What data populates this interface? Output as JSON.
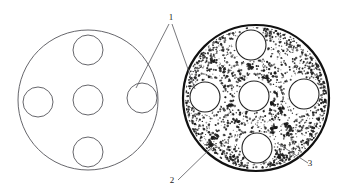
{
  "figure": {
    "background_color": "#ffffff",
    "line_color": "#55555a",
    "heavy_line_color": "#111111",
    "stipple_color": "#1a1a1a",
    "width": 342,
    "height": 194
  },
  "callouts": [
    {
      "id": "callout-1",
      "label": "1",
      "label_x": 171,
      "label_y": 20,
      "leaders": [
        {
          "x1": 169,
          "y1": 24,
          "x2": 136,
          "y2": 88
        },
        {
          "x1": 172,
          "y1": 24,
          "x2": 195,
          "y2": 89
        }
      ]
    },
    {
      "id": "callout-2",
      "label": "2",
      "label_x": 172,
      "label_y": 183,
      "leaders": [
        {
          "x1": 178,
          "y1": 180,
          "x2": 216,
          "y2": 143
        }
      ]
    },
    {
      "id": "callout-3",
      "label": "3",
      "label_x": 310,
      "label_y": 166,
      "leaders": [
        {
          "x1": 308,
          "y1": 163,
          "x2": 277,
          "y2": 143
        }
      ]
    }
  ],
  "plates": [
    {
      "id": "plate-left",
      "name": "clean-plate",
      "center_x": 88,
      "center_y": 100,
      "radius": 70,
      "stroke_width": 0.9,
      "stippled": false,
      "holes": [
        {
          "name": "hole-center",
          "cx": 88,
          "cy": 100,
          "r": 15
        },
        {
          "name": "hole-top",
          "cx": 88,
          "cy": 50,
          "r": 15
        },
        {
          "name": "hole-bottom",
          "cx": 88,
          "cy": 152,
          "r": 15
        },
        {
          "name": "hole-left",
          "cx": 38,
          "cy": 102,
          "r": 15
        },
        {
          "name": "hole-right",
          "cx": 142,
          "cy": 98,
          "r": 15
        }
      ]
    },
    {
      "id": "plate-right",
      "name": "fouled-plate",
      "center_x": 256,
      "center_y": 98,
      "radius": 73,
      "stroke_width": 2.2,
      "stippled": true,
      "holes": [
        {
          "name": "hole-center",
          "cx": 254,
          "cy": 96,
          "r": 15
        },
        {
          "name": "hole-top",
          "cx": 251,
          "cy": 45,
          "r": 15
        },
        {
          "name": "hole-bottom",
          "cx": 257,
          "cy": 148,
          "r": 15
        },
        {
          "name": "hole-left",
          "cx": 205,
          "cy": 97,
          "r": 15
        },
        {
          "name": "hole-right",
          "cx": 304,
          "cy": 94,
          "r": 15
        }
      ]
    }
  ],
  "chart_data": {
    "type": "diagram",
    "annotations": [
      {
        "number": "1",
        "points_to": "hole in plate (both plates)"
      },
      {
        "number": "2",
        "points_to": "outer rim of right plate"
      },
      {
        "number": "3",
        "points_to": "stippled surface region of right plate"
      }
    ],
    "legend_position": "none",
    "grid": false
  }
}
